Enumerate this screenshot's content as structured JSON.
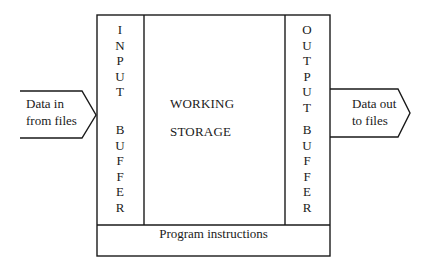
{
  "diagram": {
    "input_buffer": {
      "word1": [
        "I",
        "N",
        "P",
        "U",
        "T"
      ],
      "word2": [
        "B",
        "U",
        "F",
        "F",
        "E",
        "R"
      ]
    },
    "output_buffer": {
      "word1": [
        "O",
        "U",
        "T",
        "P",
        "U",
        "T"
      ],
      "word2": [
        "B",
        "U",
        "F",
        "F",
        "E",
        "R"
      ]
    },
    "working_storage": {
      "line1": "WORKING",
      "line2": "STORAGE"
    },
    "program_instructions": "Program instructions",
    "input_arrow": {
      "line1": "Data in",
      "line2": "from files"
    },
    "output_arrow": {
      "line1": "Data out",
      "line2": "to files"
    },
    "colors": {
      "line": "#1a1a1a",
      "background": "#ffffff"
    }
  }
}
